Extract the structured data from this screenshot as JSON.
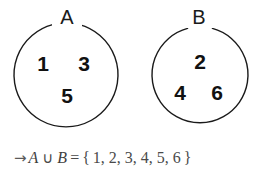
{
  "diagram": {
    "type": "venn-diagram-disjoint-sets",
    "sets": [
      {
        "label": "A",
        "elements": [
          "1",
          "3",
          "5"
        ]
      },
      {
        "label": "B",
        "elements": [
          "2",
          "4",
          "6"
        ]
      }
    ],
    "result": {
      "arrow": "→",
      "left_operand": "A",
      "operator": "∪",
      "right_operand": "B",
      "equals": "=",
      "open_brace": "{",
      "members": "1, 2, 3, 4, 5, 6",
      "close_brace": "}",
      "full_text": "→ A ∪ B = { 1, 2, 3, 4, 5, 6 }"
    },
    "colors": {
      "background": "#ffffff",
      "circle_stroke": "#1a1a1a",
      "label_text": "#1a1a1a",
      "element_text": "#111111",
      "equation_text": "#4a4a4a"
    }
  }
}
